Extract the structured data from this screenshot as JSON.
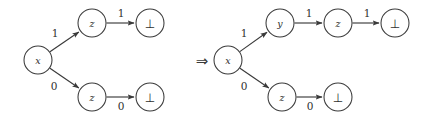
{
  "figure": {
    "kind": "graph-rewrite-diagram",
    "implies_symbol": "⇒",
    "bottom_symbol": "⊥",
    "graphs": [
      {
        "name": "left-graph",
        "nodes": [
          {
            "id": "l-x",
            "label": "x",
            "cx": 38,
            "cy": 60,
            "r": 14,
            "style": "italic"
          },
          {
            "id": "l-z-top",
            "label": "z",
            "cx": 92,
            "cy": 23,
            "r": 14,
            "style": "italic"
          },
          {
            "id": "l-bot-top",
            "label": "⊥",
            "cx": 150,
            "cy": 23,
            "r": 14,
            "style": "symbol"
          },
          {
            "id": "l-z-bot",
            "label": "z",
            "cx": 92,
            "cy": 97,
            "r": 14,
            "style": "italic"
          },
          {
            "id": "l-bot-bot",
            "label": "⊥",
            "cx": 150,
            "cy": 97,
            "r": 14,
            "style": "symbol"
          }
        ],
        "edges": [
          {
            "id": "l-e1",
            "from": "l-x",
            "to": "l-z-top",
            "label": "1",
            "lx": 55,
            "ly": 33
          },
          {
            "id": "l-e2",
            "from": "l-z-top",
            "to": "l-bot-top",
            "label": "1",
            "lx": 121,
            "ly": 13
          },
          {
            "id": "l-e3",
            "from": "l-x",
            "to": "l-z-bot",
            "label": "0",
            "lx": 54,
            "ly": 86
          },
          {
            "id": "l-e4",
            "from": "l-z-bot",
            "to": "l-bot-bot",
            "label": "0",
            "lx": 121,
            "ly": 106
          }
        ]
      },
      {
        "name": "right-graph",
        "nodes": [
          {
            "id": "r-x",
            "label": "x",
            "cx": 228,
            "cy": 60,
            "r": 14,
            "style": "italic"
          },
          {
            "id": "r-y",
            "label": "y",
            "cx": 280,
            "cy": 23,
            "r": 14,
            "style": "italic"
          },
          {
            "id": "r-z-top",
            "label": "z",
            "cx": 338,
            "cy": 23,
            "r": 14,
            "style": "italic"
          },
          {
            "id": "r-bot-top",
            "label": "⊥",
            "cx": 395,
            "cy": 23,
            "r": 14,
            "style": "symbol"
          },
          {
            "id": "r-z-bot",
            "label": "z",
            "cx": 282,
            "cy": 97,
            "r": 14,
            "style": "italic"
          },
          {
            "id": "r-bot-bot",
            "label": "⊥",
            "cx": 338,
            "cy": 97,
            "r": 14,
            "style": "symbol"
          }
        ],
        "edges": [
          {
            "id": "r-e1",
            "from": "r-x",
            "to": "r-y",
            "label": "1",
            "lx": 244,
            "ly": 33
          },
          {
            "id": "r-e2",
            "from": "r-y",
            "to": "r-z-top",
            "label": "1",
            "lx": 309,
            "ly": 13
          },
          {
            "id": "r-e3",
            "from": "r-z-top",
            "to": "r-bot-top",
            "label": "1",
            "lx": 367,
            "ly": 13
          },
          {
            "id": "r-e4",
            "from": "r-x",
            "to": "r-z-bot",
            "label": "0",
            "lx": 244,
            "ly": 86
          },
          {
            "id": "r-e5",
            "from": "r-z-bot",
            "to": "r-bot-bot",
            "label": "0",
            "lx": 310,
            "ly": 106
          }
        ]
      }
    ],
    "implies": {
      "x": 202,
      "y": 61
    },
    "colors": {
      "stroke": "#3a3a3a",
      "text": "#2e2e2e",
      "node_fill": "#ffffff",
      "background": "#ffffff"
    }
  }
}
